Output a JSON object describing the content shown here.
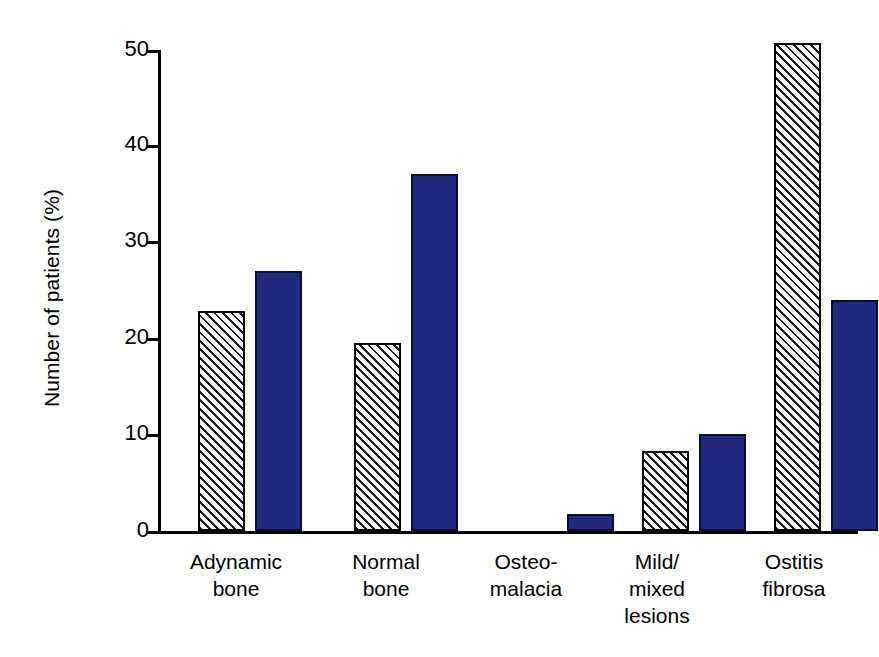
{
  "chart_data": {
    "type": "bar",
    "title": "",
    "xlabel": "",
    "ylabel": "Number of patients (%)",
    "ylim": [
      0,
      50
    ],
    "yticks": [
      0,
      10,
      20,
      30,
      40,
      50
    ],
    "grid": false,
    "legend": "none",
    "categories": [
      "Adynamic\nbone",
      "Normal\nbone",
      "Osteo-\nmalacia",
      "Mild/\nmixed\nlesions",
      "Ostitis\nfibrosa"
    ],
    "series": [
      {
        "name": "hatched",
        "style": "diagonal-hatch",
        "color": "#ffffff",
        "values": [
          22.8,
          19.5,
          0,
          8.3,
          50.5
        ]
      },
      {
        "name": "solid-navy",
        "style": "solid",
        "color": "#20297e",
        "values": [
          26.9,
          37.0,
          1.8,
          10.0,
          23.9
        ]
      }
    ]
  },
  "axis": {
    "y_label": "Number of patients (%)",
    "tick_labels": [
      "0",
      "10",
      "20",
      "30",
      "40",
      "50"
    ]
  }
}
